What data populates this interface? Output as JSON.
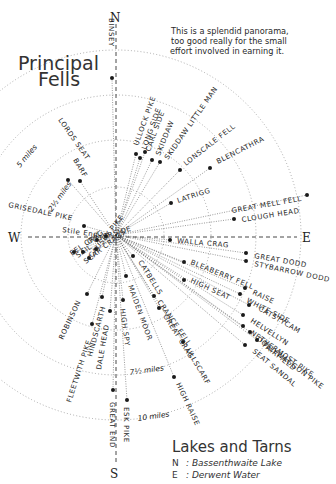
{
  "title": {
    "line1": "Principal",
    "line2": "Fells"
  },
  "note": {
    "line1": "This is a splendid panorama,",
    "line2": "too good really for the small",
    "line3": "effort involved in earning it."
  },
  "compass": {
    "N": "N",
    "E": "E",
    "S": "S",
    "W": "W"
  },
  "center": {
    "x": 116,
    "y": 235
  },
  "distance_rings": [
    {
      "label": "2½ miles",
      "r": 48
    },
    {
      "label": "5 miles",
      "r": 95
    },
    {
      "label": "7½ miles",
      "r": 140
    },
    {
      "label": "10 miles",
      "r": 185
    }
  ],
  "fells": [
    {
      "name": "BINSEY",
      "x": 112,
      "y": 78,
      "lx": 109,
      "ly": 18,
      "rot": 90
    },
    {
      "name": "LORDS SEAT",
      "x": 68,
      "y": 180,
      "lx": 58,
      "ly": 120,
      "rot": 55
    },
    {
      "name": "BARF",
      "x": 80,
      "y": 181,
      "lx": 73,
      "ly": 160,
      "rot": 60
    },
    {
      "name": "ULLOCK PIKE",
      "x": 136,
      "y": 154,
      "lx": 138,
      "ly": 146,
      "rot": -70
    },
    {
      "name": "LONG SIDE",
      "x": 140,
      "y": 158,
      "lx": 146,
      "ly": 150,
      "rot": -70
    },
    {
      "name": "CARL SIDE",
      "x": 145,
      "y": 152,
      "lx": 150,
      "ly": 152,
      "rot": -70
    },
    {
      "name": "SKIDDAW",
      "x": 152,
      "y": 160,
      "lx": 160,
      "ly": 156,
      "rot": -68
    },
    {
      "name": "SKIDDAW LITTLE MAN",
      "x": 160,
      "y": 162,
      "lx": 168,
      "ly": 160,
      "rot": -55
    },
    {
      "name": "LONSCALE FELL",
      "x": 180,
      "y": 170,
      "lx": 186,
      "ly": 166,
      "rot": -38
    },
    {
      "name": "BLENCATHRA",
      "x": 210,
      "y": 168,
      "lx": 218,
      "ly": 164,
      "rot": -27
    },
    {
      "name": "LATRIGG",
      "x": 171,
      "y": 203,
      "lx": 178,
      "ly": 203,
      "rot": -18
    },
    {
      "name": "GREAT MELL FELL",
      "x": 307,
      "y": 195,
      "lx": 232,
      "ly": 213,
      "rot": -10
    },
    {
      "name": "CLOUGH HEAD",
      "x": 234,
      "y": 219,
      "lx": 242,
      "ly": 222,
      "rot": -9
    },
    {
      "name": "WALLA CRAG",
      "x": 170,
      "y": 240,
      "lx": 177,
      "ly": 243,
      "rot": 5
    },
    {
      "name": "GREAT DODD",
      "x": 246,
      "y": 253,
      "lx": 254,
      "ly": 258,
      "rot": 10
    },
    {
      "name": "STYBARROW DODD",
      "x": 246,
      "y": 261,
      "lx": 254,
      "ly": 266,
      "rot": 12
    },
    {
      "name": "BLEABERRY FELL",
      "x": 184,
      "y": 262,
      "lx": 190,
      "ly": 264,
      "rot": 22
    },
    {
      "name": "HIGH SEAT",
      "x": 184,
      "y": 280,
      "lx": 190,
      "ly": 282,
      "rot": 25
    },
    {
      "name": "RAISE",
      "x": 245,
      "y": 288,
      "lx": 252,
      "ly": 294,
      "rot": 25
    },
    {
      "name": "WHITE SIDE",
      "x": 240,
      "y": 294,
      "lx": 246,
      "ly": 302,
      "rot": 27
    },
    {
      "name": "CATSTYCAM",
      "x": 249,
      "y": 305,
      "lx": 258,
      "ly": 310,
      "rot": 30
    },
    {
      "name": "HELVELLYN",
      "x": 243,
      "y": 315,
      "lx": 250,
      "ly": 322,
      "rot": 33
    },
    {
      "name": "NETHERMOST PIKE",
      "x": 243,
      "y": 326,
      "lx": 250,
      "ly": 334,
      "rot": 35
    },
    {
      "name": "DOLLYWAGGON PIKE",
      "x": 250,
      "y": 332,
      "lx": 256,
      "ly": 340,
      "rot": 37
    },
    {
      "name": "FAIRFIELD",
      "x": 257,
      "y": 340,
      "lx": 262,
      "ly": 346,
      "rot": 38
    },
    {
      "name": "SEAT SANDAL",
      "x": 245,
      "y": 345,
      "lx": 252,
      "ly": 352,
      "rot": 40
    },
    {
      "name": "CATBELLS",
      "x": 133,
      "y": 256,
      "lx": 138,
      "ly": 262,
      "rot": 58
    },
    {
      "name": "CAUSEY PIKE",
      "x": 96,
      "y": 249,
      "lx": 92,
      "ly": 258,
      "rot": -52
    },
    {
      "name": "OUTERSIDE",
      "x": 97,
      "y": 240,
      "lx": 88,
      "ly": 244,
      "rot": -17
    },
    {
      "name": "SAIL",
      "x": 83,
      "y": 252,
      "lx": 78,
      "ly": 258,
      "rot": -35
    },
    {
      "name": "EEL CRAG",
      "x": 74,
      "y": 252,
      "lx": 72,
      "ly": 256,
      "rot": -35
    },
    {
      "name": "SCAR CRAGS",
      "x": 89,
      "y": 258,
      "lx": 86,
      "ly": 264,
      "rot": -38
    },
    {
      "name": "GRISEDALE PIKE",
      "x": 84,
      "y": 226,
      "lx": 8,
      "ly": 207,
      "rot": 12
    },
    {
      "name": "Stile End",
      "x": 106,
      "y": 236,
      "lx": 62,
      "ly": 232,
      "rot": 8
    },
    {
      "name": "MAIDEN MOOR",
      "x": 126,
      "y": 276,
      "lx": 128,
      "ly": 286,
      "rot": 70
    },
    {
      "name": "HIGH SPY",
      "x": 123,
      "y": 300,
      "lx": 120,
      "ly": 309,
      "rot": 82
    },
    {
      "name": "DALE HEAD",
      "x": 110,
      "y": 311,
      "lx": 101,
      "ly": 370,
      "rot": -80
    },
    {
      "name": "HINDSCARTH",
      "x": 102,
      "y": 297,
      "lx": 92,
      "ly": 357,
      "rot": -75
    },
    {
      "name": "ROBINSON",
      "x": 87,
      "y": 294,
      "lx": 63,
      "ly": 340,
      "rot": -65
    },
    {
      "name": "FLEETWITH PIKE",
      "x": 92,
      "y": 324,
      "lx": 71,
      "ly": 403,
      "rot": -72
    },
    {
      "name": "CRANCE FELL",
      "x": 154,
      "y": 296,
      "lx": 157,
      "ly": 302,
      "rot": 55
    },
    {
      "name": "GREAT CRAG",
      "x": 159,
      "y": 308,
      "lx": 163,
      "ly": 316,
      "rot": 58
    },
    {
      "name": "ULLSCARF",
      "x": 183,
      "y": 342,
      "lx": 186,
      "ly": 350,
      "rot": 60
    },
    {
      "name": "HIGH RAISE",
      "x": 174,
      "y": 377,
      "lx": 176,
      "ly": 384,
      "rot": 65
    },
    {
      "name": "GREAT END",
      "x": 113,
      "y": 390,
      "lx": 110,
      "ly": 402,
      "rot": 90
    },
    {
      "name": "ESK PIKE",
      "x": 127,
      "y": 400,
      "lx": 124,
      "ly": 407,
      "rot": 90
    }
  ],
  "legend": {
    "title": "Lakes and Tarns",
    "items": [
      {
        "key": "N",
        "value": "Bassenthwaite Lake"
      },
      {
        "key": "E",
        "value": "Derwent Water"
      }
    ]
  }
}
